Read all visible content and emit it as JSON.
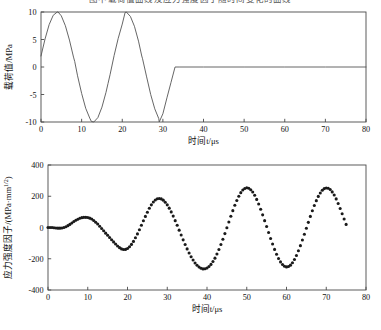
{
  "page": {
    "top_caption": "图中载荷值曲线及应力强度因子随时间变化的曲线"
  },
  "figures": [
    {
      "name": "load-history-plot",
      "xlabel": "时间t/μs",
      "ylabel": "载荷值/MPa",
      "xticks": [
        "0",
        "10",
        "20",
        "30",
        "40",
        "50",
        "60",
        "70",
        "80"
      ],
      "yticks": [
        "10",
        "5",
        "0",
        "-5",
        "-10"
      ]
    },
    {
      "name": "stress-intensity-factor-plot",
      "xlabel": "时间t/μs",
      "ylabel": "应力强度因子/(MPa·mm",
      "ylabel_sup": "1/2",
      "ylabel_tail": ")",
      "xticks": [
        "0",
        "10",
        "20",
        "30",
        "40",
        "50",
        "60",
        "70",
        "80"
      ],
      "yticks": [
        "400",
        "200",
        "0",
        "-200",
        "-400"
      ]
    }
  ],
  "chart_data": [
    {
      "type": "line",
      "name": "load-history",
      "title": "",
      "xlabel": "时间t/μs",
      "ylabel": "载荷值/MPa",
      "xlim": [
        0,
        80
      ],
      "ylim": [
        -10,
        10
      ],
      "xticks": [
        0,
        10,
        20,
        30,
        40,
        50,
        60,
        70,
        80
      ],
      "yticks": [
        -10,
        -5,
        0,
        5,
        10
      ],
      "grid": false,
      "legend": "none",
      "description": "Two full sine cycles of amplitude 10 MPa over 0-33 us, then constant zero to 80 us.",
      "x": [
        0,
        1,
        2,
        3,
        4,
        4.2,
        5,
        6,
        7,
        8,
        8.3,
        9,
        10,
        11,
        12,
        12.4,
        13,
        14,
        15,
        16,
        16.5,
        17,
        18,
        19,
        20,
        20.7,
        21,
        22,
        23,
        24,
        24.8,
        25,
        26,
        27,
        28,
        29,
        29.1,
        30,
        31,
        32,
        33,
        34,
        40,
        50,
        60,
        70,
        80
      ],
      "y": [
        2.0,
        5.1,
        7.7,
        9.4,
        10.0,
        10.0,
        9.3,
        7.5,
        4.9,
        1.8,
        1.0,
        -1.6,
        -4.8,
        -7.5,
        -9.3,
        -9.9,
        -10.0,
        -9.2,
        -7.3,
        -4.6,
        -3.0,
        -1.4,
        2.1,
        5.2,
        7.8,
        9.9,
        10.0,
        9.2,
        7.4,
        4.7,
        2.0,
        1.5,
        -1.8,
        -5.0,
        -7.6,
        -9.4,
        -10.0,
        -8.5,
        -5.6,
        -2.8,
        0.0,
        0.0,
        0.0,
        0.0,
        0.0,
        0.0,
        0.0
      ]
    },
    {
      "type": "scatter",
      "name": "stress-intensity-factor",
      "title": "",
      "xlabel": "时间t/μs",
      "ylabel": "应力强度因子/(MPa·mm^1/2)",
      "xlim": [
        0,
        80
      ],
      "ylim": [
        -400,
        400
      ],
      "xticks": [
        0,
        10,
        20,
        30,
        40,
        50,
        60,
        70,
        80
      ],
      "yticks": [
        -400,
        -200,
        0,
        200,
        400
      ],
      "grid": false,
      "legend": "none",
      "marker": "filled-circle",
      "description": "Growing oscillation: flat near zero until ~4 us, then oscillating with increasing amplitude, peaks +65 (10us), -140 (17us), +185 (26us), -265 (34us), +250 (42us), -250 (50us), +255 (58us), -240 (67us), rising to +250 at 75 us.",
      "x": [
        0,
        0.5,
        1,
        1.5,
        2,
        2.5,
        3,
        3.5,
        4,
        4.5,
        5,
        5.5,
        6,
        6.5,
        7,
        7.5,
        8,
        8.5,
        9,
        9.5,
        10,
        10.5,
        11,
        11.5,
        12,
        12.5,
        13,
        13.5,
        14,
        14.5,
        15,
        15.5,
        16,
        16.5,
        17,
        17.5,
        18,
        18.5,
        19,
        19.5,
        20,
        20.5,
        21,
        21.5,
        22,
        22.5,
        23,
        23.5,
        24,
        24.5,
        25,
        25.5,
        26,
        26.5,
        27,
        27.5,
        28,
        28.5,
        29,
        29.5,
        30,
        30.5,
        31,
        31.5,
        32,
        32.5,
        33,
        33.5,
        34,
        34.5,
        35,
        35.5,
        36,
        36.5,
        37,
        37.5,
        38,
        38.5,
        39,
        39.5,
        40,
        40.5,
        41,
        41.5,
        42,
        42.5,
        43,
        43.5,
        44,
        44.5,
        45,
        45.5,
        46,
        46.5,
        47,
        47.5,
        48,
        48.5,
        49,
        49.5,
        50,
        50.5,
        51,
        51.5,
        52,
        52.5,
        53,
        53.5,
        54,
        54.5,
        55,
        55.5,
        56,
        56.5,
        57,
        57.5,
        58,
        58.5,
        59,
        59.5,
        60,
        60.5,
        61,
        61.5,
        62,
        62.5,
        63,
        63.5,
        64,
        64.5,
        65,
        65.5,
        66,
        66.5,
        67,
        67.5,
        68,
        68.5,
        69,
        69.5,
        70,
        70.5,
        71,
        71.5,
        72,
        72.5,
        73,
        73.5,
        74,
        74.5,
        75
      ],
      "y": [
        0,
        0,
        0,
        -2,
        -3,
        -4,
        -4,
        -3,
        0,
        5,
        12,
        20,
        29,
        38,
        46,
        53,
        59,
        63,
        65,
        65,
        64,
        60,
        54,
        45,
        34,
        22,
        8,
        -6,
        -21,
        -36,
        -50,
        -64,
        -78,
        -92,
        -106,
        -118,
        -129,
        -137,
        -141,
        -140,
        -134,
        -123,
        -108,
        -89,
        -66,
        -41,
        -14,
        14,
        43,
        71,
        98,
        123,
        145,
        163,
        176,
        184,
        186,
        183,
        175,
        162,
        145,
        124,
        100,
        73,
        44,
        14,
        -17,
        -48,
        -79,
        -109,
        -137,
        -163,
        -187,
        -208,
        -227,
        -242,
        -253,
        -261,
        -265,
        -264,
        -259,
        -250,
        -236,
        -218,
        -196,
        -170,
        -141,
        -109,
        -75,
        -39,
        -2,
        35,
        72,
        108,
        142,
        173,
        200,
        223,
        240,
        250,
        254,
        251,
        242,
        227,
        206,
        180,
        150,
        117,
        81,
        44,
        6,
        -32,
        -70,
        -106,
        -140,
        -171,
        -198,
        -220,
        -237,
        -248,
        -252,
        -250,
        -241,
        -226,
        -205,
        -179,
        -149,
        -116,
        -80,
        -43,
        -5,
        33,
        71,
        107,
        141,
        172,
        199,
        221,
        238,
        249,
        253,
        251,
        243,
        228,
        208,
        183,
        154,
        122,
        88,
        54,
        20,
        -13,
        -44,
        -72,
        -97,
        -118,
        -136,
        -151,
        -163,
        -172,
        -180,
        -188,
        -196,
        -205,
        -216,
        -228,
        -238,
        -244,
        -245,
        -240,
        -229,
        -212,
        -190,
        -163,
        -132,
        -98,
        -62,
        -24,
        14,
        52,
        89,
        124,
        156,
        185,
        210,
        230,
        244,
        252
      ],
      "n_points": 152
    }
  ]
}
